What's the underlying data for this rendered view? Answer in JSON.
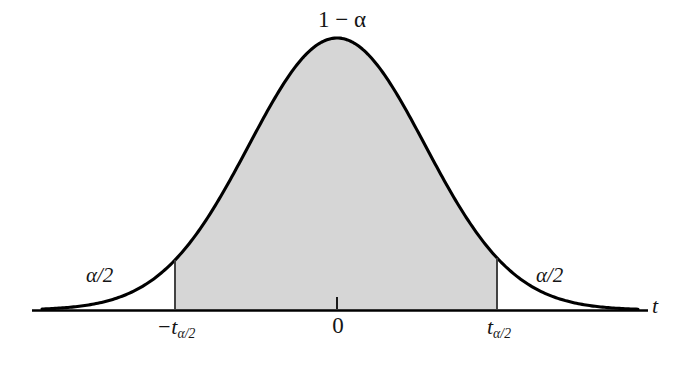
{
  "figure": {
    "kind": "t-distribution-confidence-interval",
    "background_color": "#ffffff",
    "curve_color": "#000000",
    "shade_color": "#d6d6d6",
    "axis_color": "#000000",
    "boundary_line_color": "#3a3a3a"
  },
  "labels": {
    "confidence_area": "1 − α",
    "left_tail_area": "α/2",
    "right_tail_area": "α/2",
    "center_tick": "0",
    "critical_left_base": "−t",
    "critical_left_sub": "α/2",
    "critical_right_base": "t",
    "critical_right_sub": "α/2",
    "axis_variable": "t"
  },
  "chart_data": {
    "type": "area",
    "title": "",
    "xlabel": "t",
    "ylabel": "",
    "distribution": "student-t (bell curve)",
    "grid": false,
    "legend_position": "none",
    "axis": {
      "baseline_y_px": 310,
      "x_start_px": 32,
      "x_end_px": 648,
      "center_x_px": 337,
      "peak_y_px": 38,
      "sigma_px": 88,
      "curve_left_end_px": 42,
      "curve_right_end_px": 638
    },
    "annotations": [
      {
        "name": "confidence_area",
        "text": "1 − α",
        "x_px": 337,
        "y_px": 22,
        "region": "shaded center"
      },
      {
        "name": "left_tail_area",
        "text": "α/2",
        "x_px": 105,
        "y_px": 276,
        "region": "left tail"
      },
      {
        "name": "right_tail_area",
        "text": "α/2",
        "x_px": 556,
        "y_px": 276,
        "region": "right tail"
      },
      {
        "name": "center_tick",
        "text": "0",
        "x_px": 337,
        "y_px": 325,
        "region": "axis tick"
      },
      {
        "name": "critical_left",
        "text": "−tα/2",
        "x_px": 176,
        "y_px": 327,
        "region": "axis tick"
      },
      {
        "name": "critical_right",
        "text": "tα/2",
        "x_px": 499,
        "y_px": 327,
        "region": "axis tick"
      },
      {
        "name": "axis_variable",
        "text": "t",
        "x_px": 657,
        "y_px": 305,
        "region": "axis end"
      }
    ],
    "shaded_region": {
      "label": "1 − α",
      "x_from_px": 175,
      "x_to_px": 497,
      "fill": "#d6d6d6",
      "description": "central area between the two critical values"
    },
    "tail_regions": [
      {
        "label": "α/2",
        "side": "left",
        "x_to_px": 175
      },
      {
        "label": "α/2",
        "side": "right",
        "x_from_px": 497
      }
    ],
    "boundaries": [
      {
        "name": "left-critical-line",
        "x_px": 175,
        "y_top_px": 258,
        "y_bottom_px": 310
      },
      {
        "name": "right-critical-line",
        "x_px": 497,
        "y_top_px": 258,
        "y_bottom_px": 310
      }
    ],
    "ticks": [
      {
        "x_px": 175,
        "label": "−tα/2"
      },
      {
        "x_px": 337,
        "label": "0"
      },
      {
        "x_px": 497,
        "label": "tα/2"
      }
    ]
  }
}
